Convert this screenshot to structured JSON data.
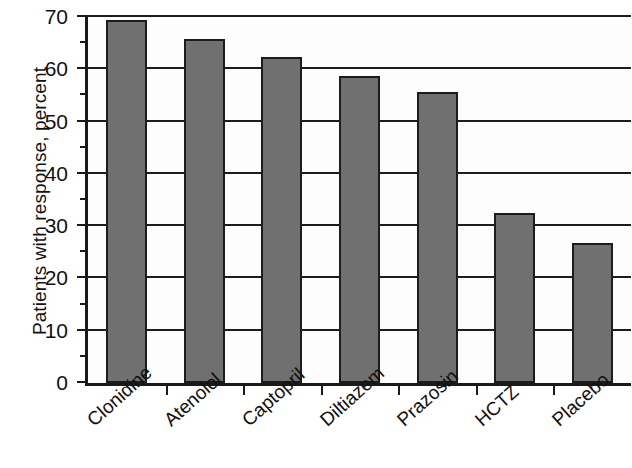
{
  "chart_data": {
    "type": "bar",
    "title": "",
    "subtitle": "",
    "xlabel": "",
    "ylabel": "Patients with response, percent",
    "categories": [
      "Clonidine",
      "Atenolol",
      "Captopril",
      "Diltiazem",
      "Prazosin",
      "HCTZ",
      "Placebo"
    ],
    "values": [
      69.4,
      65.8,
      62.3,
      58.8,
      55.6,
      32.6,
      26.8
    ],
    "ylim": [
      0,
      70
    ],
    "y_major_ticks": [
      0,
      10,
      20,
      30,
      40,
      50,
      60,
      70
    ],
    "y_minor_ticks": [
      5,
      15,
      25,
      35,
      45,
      55,
      65
    ],
    "y_tick_labels": [
      "0",
      "10",
      "20",
      "30",
      "40",
      "50",
      "60",
      "70"
    ],
    "grid": "horizontal-major-only",
    "legend": "none",
    "bar_color": "#707070",
    "bar_edge_color": "#1c1c1c",
    "axis_color": "#1a1a1a",
    "background_color": "#ffffff",
    "x_label_rotation_degrees": -42
  }
}
